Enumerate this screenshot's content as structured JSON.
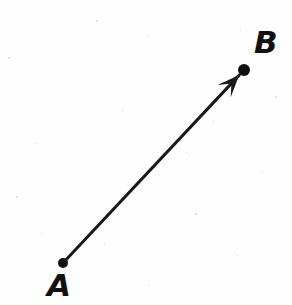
{
  "figure": {
    "type": "vector-diagram",
    "background_color": "#fefefe",
    "stroke_color": "#1a1a1a",
    "width": 292,
    "height": 305
  },
  "points": [
    {
      "id": "A",
      "label": "A",
      "x": 63,
      "y": 263,
      "dot_radius": 5,
      "label_x": 47,
      "label_y": 270,
      "role": "tail"
    },
    {
      "id": "B",
      "label": "B",
      "x": 244,
      "y": 70,
      "dot_radius": 6,
      "label_x": 254,
      "label_y": 27,
      "role": "head"
    }
  ],
  "vector": {
    "from": "A",
    "to": "B",
    "line_width": 3,
    "arrowhead": "barbed",
    "arrowhead_length": 22,
    "arrowhead_half_width": 9,
    "direction_degrees": -46.8
  },
  "specks": [
    {
      "x": 8,
      "y": 57,
      "size": 2
    },
    {
      "x": 96,
      "y": 20,
      "size": 2
    },
    {
      "x": 148,
      "y": 36,
      "size": 1
    },
    {
      "x": 240,
      "y": 30,
      "size": 1
    },
    {
      "x": 275,
      "y": 96,
      "size": 2
    },
    {
      "x": 122,
      "y": 110,
      "size": 1
    },
    {
      "x": 36,
      "y": 143,
      "size": 1
    },
    {
      "x": 186,
      "y": 152,
      "size": 1
    },
    {
      "x": 262,
      "y": 172,
      "size": 1
    },
    {
      "x": 16,
      "y": 196,
      "size": 2
    },
    {
      "x": 195,
      "y": 213,
      "size": 2
    },
    {
      "x": 104,
      "y": 243,
      "size": 1
    },
    {
      "x": 237,
      "y": 255,
      "size": 1
    },
    {
      "x": 149,
      "y": 285,
      "size": 1
    },
    {
      "x": 41,
      "y": 233,
      "size": 1
    },
    {
      "x": 213,
      "y": 121,
      "size": 1
    }
  ]
}
